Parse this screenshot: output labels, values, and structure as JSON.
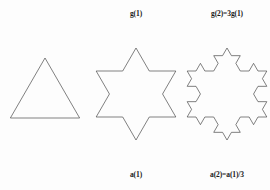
{
  "figure": {
    "background_color": "#fdfdfd",
    "stroke_color": "#4a4a4a",
    "text_color": "#1a1a1a",
    "shapes": [
      {
        "name": "triangle",
        "iteration": 0,
        "sides": 3,
        "description": "equilateral triangle"
      },
      {
        "name": "star-of-david",
        "iteration": 1,
        "sides": 12,
        "description": "six pointed star, Koch snowflake iteration 1"
      },
      {
        "name": "koch-snowflake",
        "iteration": 2,
        "sides": 48,
        "description": "Koch snowflake iteration 2"
      }
    ],
    "labels": {
      "top_center": "g(1)",
      "top_right": "g(2)=3g(1)",
      "bottom_center": "a(1)",
      "bottom_right": "a(2)=a(1)/3"
    }
  },
  "chart_data": {
    "type": "diagram",
    "title": "",
    "panels": [
      {
        "index": 0,
        "shape": "triangle",
        "iteration": 0,
        "segment_count": 3,
        "top_label": "",
        "bottom_label": ""
      },
      {
        "index": 1,
        "shape": "star-of-david",
        "iteration": 1,
        "segment_count": 12,
        "top_label": "g(1)",
        "bottom_label": "a(1)"
      },
      {
        "index": 2,
        "shape": "koch-snowflake",
        "iteration": 2,
        "segment_count": 48,
        "top_label": "g(2)=3g(1)",
        "bottom_label": "a(2)=a(1)/3"
      }
    ],
    "relations": [
      {
        "quantity": "g",
        "meaning": "number of generator segments",
        "formula": "g(2)=3g(1)"
      },
      {
        "quantity": "a",
        "meaning": "segment length",
        "formula": "a(2)=a(1)/3"
      }
    ]
  }
}
